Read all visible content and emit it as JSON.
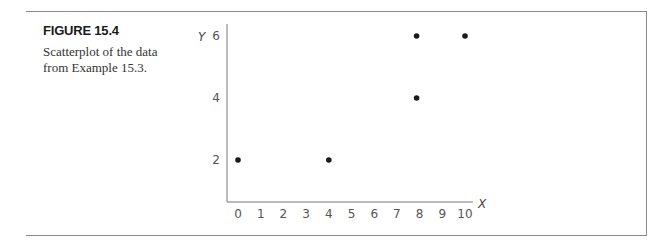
{
  "figure": {
    "title": "FIGURE 15.4",
    "caption": "Scatterplot of the data from Example 15.3."
  },
  "chart_data": {
    "type": "scatter",
    "title": "",
    "xlabel": "X",
    "ylabel": "Y",
    "xlim": [
      0,
      10
    ],
    "ylim": [
      2,
      6
    ],
    "x_ticks": [
      0,
      1,
      2,
      3,
      4,
      5,
      6,
      7,
      8,
      9,
      10
    ],
    "y_ticks": [
      2,
      4,
      6
    ],
    "grid": false,
    "legend": null,
    "points": [
      {
        "x": 0,
        "y": 2
      },
      {
        "x": 4,
        "y": 2
      },
      {
        "x": 8,
        "y": 4
      },
      {
        "x": 8,
        "y": 6
      },
      {
        "x": 10,
        "y": 6
      }
    ]
  }
}
